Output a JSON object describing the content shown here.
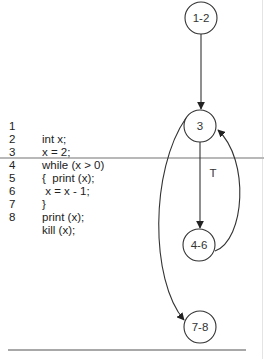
{
  "code": {
    "lines": [
      {
        "num": "1",
        "text": "int x;"
      },
      {
        "num": "2",
        "text": "x = 2;"
      },
      {
        "num": "3",
        "text": "while (x > 0)"
      },
      {
        "num": "4",
        "text": "{  print (x);"
      },
      {
        "num": "5",
        "text": " x = x - 1;"
      },
      {
        "num": "6",
        "text": "}"
      },
      {
        "num": "7",
        "text": "print (x);"
      },
      {
        "num": "8",
        "text": "kill (x);"
      }
    ]
  },
  "graph": {
    "nodes": [
      {
        "id": "n12",
        "label": "1-2",
        "cx": 201,
        "cy": 18
      },
      {
        "id": "n3",
        "label": "3",
        "cx": 200,
        "cy": 126
      },
      {
        "id": "n46",
        "label": "4-6",
        "cx": 199,
        "cy": 245
      },
      {
        "id": "n78",
        "label": "7-8",
        "cx": 200,
        "cy": 327
      }
    ],
    "edges": [
      {
        "from": "1-2",
        "to": "3",
        "label": ""
      },
      {
        "from": "3",
        "to": "4-6",
        "label": "T"
      },
      {
        "from": "4-6",
        "to": "3",
        "label": ""
      },
      {
        "from": "3",
        "to": "7-8",
        "label": ""
      }
    ],
    "true_label": "T"
  }
}
